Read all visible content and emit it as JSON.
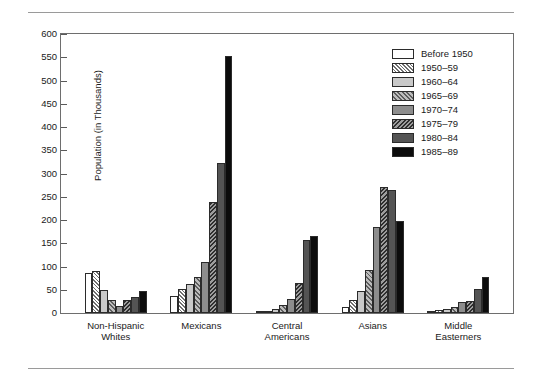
{
  "chart_data": {
    "type": "bar",
    "title": "",
    "xlabel": "",
    "ylabel": "Population (in Thousands)",
    "ylim": [
      0,
      600
    ],
    "yticks": [
      0,
      50,
      100,
      150,
      200,
      250,
      300,
      350,
      400,
      450,
      500,
      550,
      600
    ],
    "grid": false,
    "legend_position": "top-right",
    "categories": [
      "Non-Hispanic\nWhites",
      "Mexicans",
      "Central\nAmericans",
      "Asians",
      "Middle\nEasterners"
    ],
    "series": [
      {
        "name": "Before 1950",
        "values": [
          86,
          37,
          2,
          14,
          4
        ]
      },
      {
        "name": "1950–59",
        "values": [
          90,
          52,
          5,
          28,
          6
        ]
      },
      {
        "name": "1960–64",
        "values": [
          50,
          62,
          8,
          48,
          8
        ]
      },
      {
        "name": "1965–69",
        "values": [
          27,
          78,
          17,
          92,
          13
        ]
      },
      {
        "name": "1970–74",
        "values": [
          16,
          110,
          30,
          185,
          24
        ]
      },
      {
        "name": "1975–79",
        "values": [
          27,
          238,
          65,
          272,
          25
        ]
      },
      {
        "name": "1980–84",
        "values": [
          35,
          322,
          158,
          265,
          52
        ]
      },
      {
        "name": "1985–89",
        "values": [
          47,
          552,
          165,
          198,
          77
        ]
      }
    ]
  },
  "colors": {
    "before_1950": "#ffffff",
    "y1950_59": "#d8d8d8",
    "y1960_64": "#c9c9c9",
    "y1965_69": "#bdbdbd",
    "y1970_74": "#8d8d8d",
    "y1975_79": "#7c7c7c",
    "y1980_84": "#545454",
    "y1985_89": "#0c0c0c",
    "axis": "#6e6e6e",
    "rule": "#9a9a9a"
  }
}
